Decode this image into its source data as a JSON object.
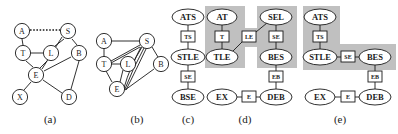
{
  "figure": {
    "panels": [
      {
        "id": "a",
        "caption": "(a)",
        "type": "undirected-graph",
        "nodes": [
          {
            "id": "A",
            "label": "A",
            "x": 22,
            "y": 31
          },
          {
            "id": "S",
            "label": "S",
            "x": 68,
            "y": 31
          },
          {
            "id": "T",
            "label": "T",
            "x": 23,
            "y": 53
          },
          {
            "id": "L",
            "label": "L",
            "x": 51,
            "y": 53
          },
          {
            "id": "B",
            "label": "B",
            "x": 79,
            "y": 53
          },
          {
            "id": "E",
            "label": "E",
            "x": 36,
            "y": 75
          },
          {
            "id": "X",
            "label": "X",
            "x": 20,
            "y": 97
          },
          {
            "id": "D",
            "label": "D",
            "x": 69,
            "y": 97
          }
        ],
        "edges": [
          {
            "from": "A",
            "to": "S",
            "style": "dotted"
          },
          {
            "from": "A",
            "to": "T",
            "style": "solid"
          },
          {
            "from": "T",
            "to": "L",
            "style": "solid"
          },
          {
            "from": "T",
            "to": "E",
            "style": "solid"
          },
          {
            "from": "L",
            "to": "E",
            "style": "solid"
          },
          {
            "from": "S",
            "to": "L",
            "style": "solid"
          },
          {
            "from": "S",
            "to": "B",
            "style": "solid"
          },
          {
            "from": "B",
            "to": "E",
            "style": "solid"
          },
          {
            "from": "B",
            "to": "D",
            "style": "solid"
          },
          {
            "from": "E",
            "to": "X",
            "style": "solid"
          },
          {
            "from": "E",
            "to": "D",
            "style": "solid"
          },
          {
            "from": "E",
            "to": "S",
            "style": "solid"
          }
        ]
      },
      {
        "id": "b",
        "caption": "(b)",
        "type": "undirected-graph",
        "nodes": [
          {
            "id": "A",
            "label": "A",
            "x": 104,
            "y": 41
          },
          {
            "id": "S",
            "label": "S",
            "x": 147,
            "y": 41
          },
          {
            "id": "T",
            "label": "T",
            "x": 104,
            "y": 64
          },
          {
            "id": "L",
            "label": "L",
            "x": 128,
            "y": 64
          },
          {
            "id": "B",
            "label": "B",
            "x": 161,
            "y": 64
          },
          {
            "id": "E",
            "label": "E",
            "x": 117,
            "y": 89
          }
        ],
        "edges": [
          {
            "from": "A",
            "to": "S",
            "style": "solid"
          },
          {
            "from": "A",
            "to": "T",
            "style": "solid"
          },
          {
            "from": "T",
            "to": "L",
            "style": "solid"
          },
          {
            "from": "T",
            "to": "S",
            "style": "solid"
          },
          {
            "from": "T",
            "to": "E",
            "style": "solid"
          },
          {
            "from": "L",
            "to": "S",
            "style": "solid"
          },
          {
            "from": "L",
            "to": "E",
            "style": "solid"
          },
          {
            "from": "S",
            "to": "E",
            "style": "solid"
          },
          {
            "from": "S",
            "to": "B",
            "style": "solid"
          },
          {
            "from": "B",
            "to": "E",
            "style": "solid"
          }
        ]
      },
      {
        "id": "c",
        "caption": "(c)",
        "type": "clique-tree",
        "cliques": [
          {
            "id": "ATS",
            "label": "ATS",
            "x": 188,
            "y": 17
          },
          {
            "id": "STLE",
            "label": "STLE",
            "x": 188,
            "y": 57
          },
          {
            "id": "BSE",
            "label": "BSE",
            "x": 188,
            "y": 97
          }
        ],
        "separators": [
          {
            "id": "TS",
            "label": "TS",
            "x": 188,
            "y": 37
          },
          {
            "id": "SE",
            "label": "SE",
            "x": 188,
            "y": 77
          }
        ],
        "links": [
          {
            "from": "ATS",
            "to": "TS"
          },
          {
            "from": "TS",
            "to": "STLE"
          },
          {
            "from": "STLE",
            "to": "SE"
          },
          {
            "from": "SE",
            "to": "BSE"
          }
        ],
        "highlight": {
          "shape": "none"
        }
      },
      {
        "id": "d",
        "caption": "(d)",
        "type": "clique-tree",
        "cliques": [
          {
            "id": "AT",
            "label": "AT",
            "x": 222,
            "y": 17
          },
          {
            "id": "SEL",
            "label": "SEL",
            "x": 276,
            "y": 17
          },
          {
            "id": "TLE",
            "label": "TLE",
            "x": 222,
            "y": 57
          },
          {
            "id": "BES",
            "label": "BES",
            "x": 276,
            "y": 57
          },
          {
            "id": "EX",
            "label": "EX",
            "x": 222,
            "y": 97
          },
          {
            "id": "DEB",
            "label": "DEB",
            "x": 276,
            "y": 97
          }
        ],
        "separators": [
          {
            "id": "T",
            "label": "T",
            "x": 222,
            "y": 37
          },
          {
            "id": "LE",
            "label": "LE",
            "x": 249,
            "y": 37
          },
          {
            "id": "SE",
            "label": "SE",
            "x": 276,
            "y": 37
          },
          {
            "id": "EB",
            "label": "EB",
            "x": 276,
            "y": 77
          },
          {
            "id": "E",
            "label": "E",
            "x": 249,
            "y": 97
          }
        ],
        "links": [
          {
            "from": "AT",
            "to": "T"
          },
          {
            "from": "T",
            "to": "TLE"
          },
          {
            "from": "TLE",
            "to": "LE"
          },
          {
            "from": "LE",
            "to": "SEL"
          },
          {
            "from": "SEL",
            "to": "SE"
          },
          {
            "from": "SE",
            "to": "BES"
          },
          {
            "from": "BES",
            "to": "EB"
          },
          {
            "from": "EB",
            "to": "DEB"
          },
          {
            "from": "DEB",
            "to": "E"
          },
          {
            "from": "E",
            "to": "EX"
          }
        ],
        "highlight": {
          "shape": "two-columns",
          "color": "#c0c0c0"
        }
      },
      {
        "id": "e",
        "caption": "(e)",
        "type": "clique-tree",
        "cliques": [
          {
            "id": "ATS",
            "label": "ATS",
            "x": 320,
            "y": 17
          },
          {
            "id": "STLE",
            "label": "STLE",
            "x": 320,
            "y": 57
          },
          {
            "id": "BES",
            "label": "BES",
            "x": 375,
            "y": 57
          },
          {
            "id": "EX",
            "label": "EX",
            "x": 320,
            "y": 97
          },
          {
            "id": "DEB",
            "label": "DEB",
            "x": 375,
            "y": 97
          }
        ],
        "separators": [
          {
            "id": "TS",
            "label": "TS",
            "x": 320,
            "y": 37
          },
          {
            "id": "SE",
            "label": "SE",
            "x": 348,
            "y": 57
          },
          {
            "id": "EB",
            "label": "EB",
            "x": 375,
            "y": 77
          },
          {
            "id": "E",
            "label": "E",
            "x": 348,
            "y": 97
          }
        ],
        "links": [
          {
            "from": "ATS",
            "to": "TS"
          },
          {
            "from": "TS",
            "to": "STLE"
          },
          {
            "from": "STLE",
            "to": "SE"
          },
          {
            "from": "SE",
            "to": "BES"
          },
          {
            "from": "BES",
            "to": "EB"
          },
          {
            "from": "EB",
            "to": "DEB"
          },
          {
            "from": "DEB",
            "to": "E"
          },
          {
            "from": "E",
            "to": "EX"
          }
        ],
        "highlight": {
          "shape": "L-shape",
          "color": "#c0c0c0"
        }
      }
    ],
    "colors": {
      "stroke": "#1a1a1a",
      "node_fill": "#ffffff",
      "highlight": "#c0c0c0",
      "background": "#ffffff"
    }
  }
}
